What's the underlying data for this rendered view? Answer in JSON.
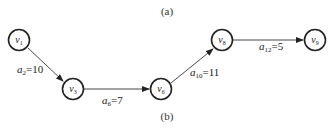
{
  "captions": {
    "top": "(a)",
    "bottom": "(b)"
  },
  "nodes": [
    {
      "id": "v1",
      "name": "v",
      "sub": "1",
      "cx": 19,
      "cy": 40
    },
    {
      "id": "v3",
      "name": "v",
      "sub": "3",
      "cx": 73,
      "cy": 89
    },
    {
      "id": "v6",
      "name": "v",
      "sub": "6",
      "cx": 161,
      "cy": 89
    },
    {
      "id": "v8",
      "name": "v",
      "sub": "8",
      "cx": 222,
      "cy": 40
    },
    {
      "id": "v9",
      "name": "v",
      "sub": "9",
      "cx": 315,
      "cy": 40
    }
  ],
  "edges": [
    {
      "from": "v1",
      "to": "v3",
      "var": "a",
      "sub": "2",
      "value": "=10"
    },
    {
      "from": "v3",
      "to": "v6",
      "var": "a",
      "sub": "6",
      "value": "=7"
    },
    {
      "from": "v6",
      "to": "v8",
      "var": "a",
      "sub": "10",
      "value": "=11"
    },
    {
      "from": "v8",
      "to": "v9",
      "var": "a",
      "sub": "12",
      "value": "=5"
    }
  ]
}
